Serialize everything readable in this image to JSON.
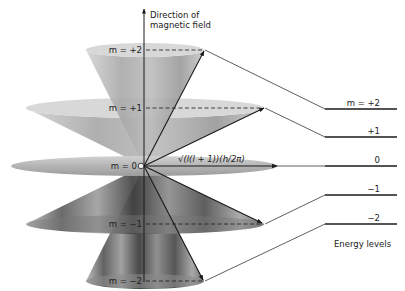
{
  "axis": {
    "label_line1": "Direction of",
    "label_line2": "magnetic field"
  },
  "cones": [
    {
      "m_label": "m = +2",
      "m": "+2"
    },
    {
      "m_label": "m = +1",
      "m": "+1"
    },
    {
      "m_label": "m = 0",
      "m": "0"
    },
    {
      "m_label": "m = −1",
      "m": "-1"
    },
    {
      "m_label": "m = −2",
      "m": "-2"
    }
  ],
  "vector_label": "√(l(l + 1))(h/2π)",
  "energy_levels": {
    "title": "Energy levels",
    "levels": [
      "m = +2",
      "+1",
      "0",
      "−1",
      "−2"
    ]
  },
  "colors": {
    "cone_light": "#c9c9c9",
    "cone_mid": "#9a9a9a",
    "cone_dark": "#4a4a4a",
    "line": "#1a1a1a"
  }
}
